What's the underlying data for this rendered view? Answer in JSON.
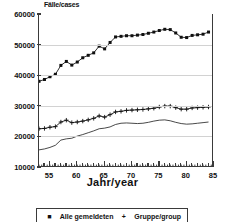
{
  "chart_data": {
    "type": "line",
    "title": "",
    "ylabel": "Fälle/cases",
    "xlabel": "Jahr/year",
    "ylim": [
      10000,
      60000
    ],
    "xlim": [
      1953,
      1985
    ],
    "grid": true,
    "legend_position": "below-axes",
    "ytick_labels": [
      "10000",
      "20000",
      "30000",
      "40000",
      "50000",
      "60000"
    ],
    "ytick_values": [
      10000,
      20000,
      30000,
      40000,
      50000,
      60000
    ],
    "xtick_labels": [
      "55",
      "60",
      "65",
      "70",
      "75",
      "80",
      "85"
    ],
    "xtick_values": [
      1955,
      1960,
      1965,
      1970,
      1975,
      1980,
      1985
    ],
    "x": [
      1953,
      1954,
      1955,
      1956,
      1957,
      1958,
      1959,
      1960,
      1961,
      1962,
      1963,
      1964,
      1965,
      1966,
      1967,
      1968,
      1969,
      1970,
      1971,
      1972,
      1973,
      1974,
      1975,
      1976,
      1977,
      1978,
      1979,
      1980,
      1981,
      1982,
      1983,
      1984
    ],
    "series": [
      {
        "name": "Alle gemeldeten Fälle / all cases",
        "marker": "filled-square",
        "values": [
          38000,
          38600,
          39500,
          40300,
          43200,
          44500,
          43300,
          44300,
          45700,
          46500,
          47300,
          49500,
          48600,
          50700,
          52500,
          52700,
          52900,
          52900,
          53100,
          53300,
          53700,
          54100,
          54600,
          55000,
          54900,
          53800,
          52400,
          52300,
          53000,
          53200,
          53400,
          54100
        ]
      },
      {
        "name": "Gruppe 2 / group 2",
        "marker": "plus",
        "values": [
          22500,
          22600,
          23000,
          23200,
          24700,
          25300,
          24500,
          24700,
          25000,
          25400,
          25900,
          26700,
          26300,
          27100,
          28000,
          28200,
          28500,
          28600,
          28700,
          28800,
          29000,
          29200,
          29600,
          29900,
          29900,
          29400,
          28900,
          28900,
          29300,
          29400,
          29500,
          29600
        ]
      },
      {
        "name": "Gruppe 3 / group 3",
        "marker": "none",
        "values": [
          15600,
          15900,
          16400,
          17100,
          18800,
          19200,
          19400,
          20100,
          20600,
          21200,
          21800,
          22500,
          22700,
          23100,
          23900,
          24300,
          24400,
          24300,
          24200,
          24300,
          24600,
          25000,
          25300,
          25400,
          25100,
          24600,
          24200,
          24000,
          24100,
          24300,
          24500,
          24700
        ]
      }
    ]
  },
  "legend": {
    "entries": [
      {
        "marker_glyph": "■",
        "label": "Alle gemeldeten"
      },
      {
        "marker_glyph": "+",
        "label": "Gruppe/group"
      }
    ]
  }
}
